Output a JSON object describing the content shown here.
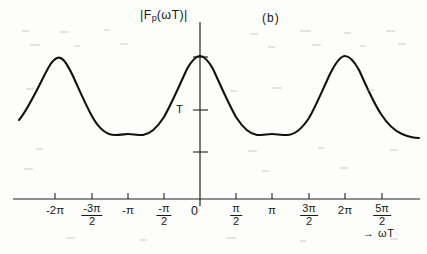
{
  "figure": {
    "panel_label": "(b)",
    "y_axis_title_parts": {
      "before": "|F",
      "subscript": "p",
      "after": "(ωT)|"
    },
    "y_axis_title": "|Fₚ(ωT)|",
    "y_tick_label": "T",
    "origin_label": "0",
    "x_axis_name": "→ ωT",
    "x_axis_arrow": "→",
    "x_axis_variable": "ωT"
  },
  "x_ticks": [
    {
      "value": -2.0,
      "label": "-2π",
      "type": "plain",
      "px": 55
    },
    {
      "value": -1.5,
      "label": "-3π/2",
      "type": "fraction",
      "num": "-3π",
      "den": "2",
      "px": 92
    },
    {
      "value": -1.0,
      "label": "-π",
      "type": "plain",
      "px": 128
    },
    {
      "value": -0.5,
      "label": "-π/2",
      "type": "fraction",
      "num": "-π",
      "den": "2",
      "px": 164
    },
    {
      "value": 0.0,
      "label": "0",
      "type": "origin",
      "px": 200
    },
    {
      "value": 0.5,
      "label": "π/2",
      "type": "fraction",
      "num": "π",
      "den": "2",
      "px": 236
    },
    {
      "value": 1.0,
      "label": "π",
      "type": "plain",
      "px": 272
    },
    {
      "value": 1.5,
      "label": "3π/2",
      "type": "fraction",
      "num": "3π",
      "den": "2",
      "px": 309
    },
    {
      "value": 2.0,
      "label": "2π",
      "type": "plain",
      "px": 345
    },
    {
      "value": 2.5,
      "label": "5π/2",
      "type": "fraction",
      "num": "5π",
      "den": "2",
      "px": 382
    }
  ],
  "chart_data": {
    "type": "line",
    "title": "(b)",
    "xlabel": "ωT",
    "ylabel": "|Fₚ(ωT)|",
    "grid": false,
    "legend": null,
    "xlim": [
      -2.62,
      2.85
    ],
    "ylim": [
      0,
      2.55
    ],
    "xtick_labels": [
      "-2π",
      "-3π/2",
      "-π",
      "-π/2",
      "0",
      "π/2",
      "π",
      "3π/2",
      "2π",
      "5π/2"
    ],
    "xtick_values": [
      -2.0,
      -1.5,
      -1.0,
      -0.5,
      0.0,
      0.5,
      1.0,
      1.5,
      2.0,
      2.5
    ],
    "ytick_labels": [
      "T"
    ],
    "ytick_values": [
      1.0
    ],
    "x_units": "multiples of π",
    "y_units": "multiples of T",
    "peaks": [
      {
        "x": -2.0,
        "y": 2.42
      },
      {
        "x": 0.0,
        "y": 2.42
      },
      {
        "x": 2.0,
        "y": 2.42
      }
    ],
    "troughs": [
      {
        "x": -1.0,
        "y": 0.53
      },
      {
        "x": 1.0,
        "y": 0.53
      }
    ],
    "series": [
      {
        "name": "|Fp(ωT)|",
        "x": [
          -2.62,
          -2.5,
          -2.35,
          -2.2,
          -2.1,
          -2.0,
          -1.9,
          -1.8,
          -1.65,
          -1.5,
          -1.35,
          -1.2,
          -1.1,
          -1.0,
          -0.9,
          -0.8,
          -0.65,
          -0.5,
          -0.35,
          -0.2,
          -0.1,
          0.0,
          0.1,
          0.2,
          0.35,
          0.5,
          0.65,
          0.8,
          0.9,
          1.0,
          1.1,
          1.2,
          1.35,
          1.5,
          1.65,
          1.8,
          1.9,
          2.0,
          2.1,
          2.2,
          2.35,
          2.5,
          2.65,
          2.85
        ],
        "y": [
          1.18,
          1.52,
          1.92,
          2.24,
          2.38,
          2.42,
          2.38,
          2.24,
          1.86,
          1.4,
          1.0,
          0.7,
          0.58,
          0.53,
          0.58,
          0.7,
          1.0,
          1.4,
          1.86,
          2.24,
          2.38,
          2.42,
          2.38,
          2.24,
          1.86,
          1.4,
          1.0,
          0.7,
          0.58,
          0.53,
          0.58,
          0.7,
          1.0,
          1.4,
          1.86,
          2.24,
          2.38,
          2.42,
          2.38,
          2.24,
          1.86,
          1.45,
          1.1,
          0.82
        ]
      }
    ],
    "y_axis_ticks_px": [
      57,
      110,
      152
    ],
    "axis_baseline_px": 199,
    "y_axis_px": 200
  },
  "colors": {
    "curve": "#111111",
    "axis": "#222222",
    "text": "#1a1a1a",
    "background": "#fdfdfc"
  }
}
